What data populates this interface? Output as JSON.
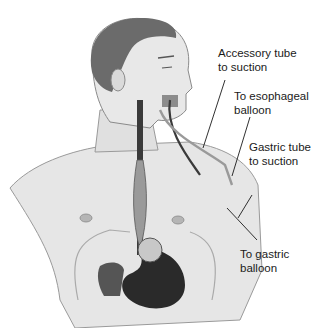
{
  "diagram": {
    "colors": {
      "skin": "#e4e4e4",
      "skin_outline": "#9a9a9a",
      "hair": "#6a6a6a",
      "stomach": "#2a2a2a",
      "tube": "#3a3a3a",
      "balloon": "#c8c8c8",
      "leader_line": "#1a1a1a"
    },
    "labels": [
      {
        "id": "accessory-tube",
        "line1": "Accessory tube",
        "line2": "to suction"
      },
      {
        "id": "esophageal-balloon",
        "line1": "To esophageal",
        "line2": "balloon"
      },
      {
        "id": "gastric-tube",
        "line1": "Gastric tube",
        "line2": "to suction"
      },
      {
        "id": "gastric-balloon",
        "line1": "To gastric",
        "line2": "balloon"
      }
    ]
  }
}
